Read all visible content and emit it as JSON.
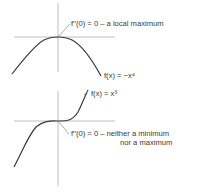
{
  "diagram": {
    "top": {
      "function_label": "f(x) = −x⁴",
      "annotation": "f′′(0) = 0 – a local maximum"
    },
    "bottom": {
      "function_label": "f(x) = x³",
      "annotation_line1": "f′′(0) = 0 – neither a minimum",
      "annotation_line2": "nor a maximum"
    },
    "colors": {
      "axis": "#b8b8b8",
      "curve": "#3a3a3a",
      "text": "#3a3a3a"
    }
  }
}
